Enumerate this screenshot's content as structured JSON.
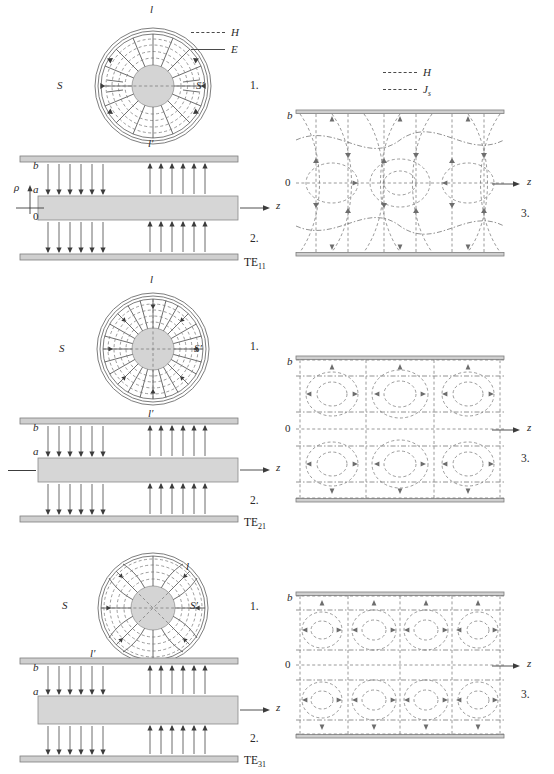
{
  "figure": {
    "panel_numbers": {
      "cross_section": "1.",
      "longitudinal": "2.",
      "wall_view": "3."
    },
    "colors": {
      "core_fill": "#d4d4d4",
      "conductor_fill": "#cfcfcf",
      "e_field": "#3c3c3c",
      "h_field": "#7a7a7a",
      "js_field": "#6d6d6d",
      "text": "#1a1a1a"
    }
  },
  "legend_left": {
    "items": [
      {
        "label": "H",
        "style": "dashed"
      },
      {
        "label": "E",
        "style": "solid"
      }
    ]
  },
  "legend_right": {
    "items": [
      {
        "label": "H",
        "style": "dashed"
      },
      {
        "label": "J",
        "sub": "s",
        "style": "dash-dot"
      }
    ]
  },
  "axes": {
    "rho_symbol": "ρ",
    "z_symbol": "z",
    "radius_outer": "b",
    "radius_inner": "a",
    "origin": "0"
  },
  "cross_section_labels": {
    "top": "l",
    "bottom": "l′",
    "left": "S",
    "right": "S′"
  },
  "rows": [
    {
      "mode": "TE",
      "mode_sub": "11",
      "azimuthal_order": 1,
      "cross_labels": {
        "l": "l",
        "lprime": "l′",
        "S": "S",
        "Sprime": "S′"
      },
      "cross_label_placement": "vertical",
      "long_labels": {
        "b": "b",
        "a": "a",
        "zero": "0",
        "rho": "ρ",
        "z": "z"
      },
      "wall_labels": {
        "b": "b",
        "zero": "0",
        "z": "z"
      },
      "has_rho_axis": true
    },
    {
      "mode": "TE",
      "mode_sub": "21",
      "azimuthal_order": 2,
      "cross_labels": {
        "l": "l",
        "lprime": "l′",
        "S": "S",
        "Sprime": "S′"
      },
      "cross_label_placement": "vertical",
      "long_labels": {
        "b": "b",
        "a": "a",
        "z": "z"
      },
      "wall_labels": {
        "b": "b",
        "zero": "0",
        "z": "z"
      },
      "has_rho_axis": false
    },
    {
      "mode": "TE",
      "mode_sub": "31",
      "azimuthal_order": 3,
      "cross_labels": {
        "l": "l",
        "lprime": "l′",
        "S": "S",
        "Sprime": "S′"
      },
      "cross_label_placement": "diagonal",
      "long_labels": {
        "b": "b",
        "a": "a",
        "z": "z"
      },
      "wall_labels": {
        "b": "b",
        "zero": "0",
        "z": "z"
      },
      "has_rho_axis": false
    }
  ]
}
